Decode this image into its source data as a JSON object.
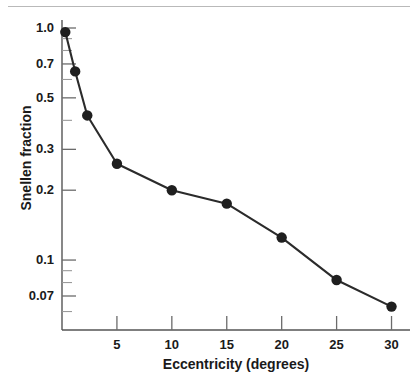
{
  "figure": {
    "background_color": "#ffffff",
    "top_rule_color": "#b9b9b9",
    "line_color": "#2b2b2b",
    "marker_color": "#1f1f1f",
    "axis_color": "#555555",
    "text_color": "#1a1a1a"
  },
  "chart_data": {
    "type": "line",
    "title": "",
    "xlabel": "Eccentricity (degrees)",
    "ylabel": "Snellen fraction",
    "xlim": [
      0,
      31.5
    ],
    "ylim": [
      0.055,
      1.12
    ],
    "yscale": "log",
    "xscale": "linear",
    "grid": false,
    "legend": "none",
    "markers": "filled-circle",
    "x": [
      0.3,
      1.2,
      2.3,
      5.0,
      10.0,
      15.0,
      20.0,
      25.0,
      30.0
    ],
    "y": [
      0.96,
      0.65,
      0.42,
      0.26,
      0.2,
      0.175,
      0.125,
      0.082,
      0.063
    ],
    "points": [
      {
        "x": 0.3,
        "y": 0.96
      },
      {
        "x": 1.2,
        "y": 0.65
      },
      {
        "x": 2.3,
        "y": 0.42
      },
      {
        "x": 5.0,
        "y": 0.26
      },
      {
        "x": 10.0,
        "y": 0.2
      },
      {
        "x": 15.0,
        "y": 0.175
      },
      {
        "x": 20.0,
        "y": 0.125
      },
      {
        "x": 25.0,
        "y": 0.082
      },
      {
        "x": 30.0,
        "y": 0.063
      }
    ],
    "xticks": [
      5,
      10,
      15,
      20,
      25,
      30
    ],
    "xtick_labels": [
      "5",
      "10",
      "15",
      "20",
      "25",
      "30"
    ],
    "yticks": [
      1.0,
      0.7,
      0.5,
      0.3,
      0.2,
      0.1,
      0.07
    ],
    "ytick_labels": [
      "1.0",
      "0.7",
      "0.5",
      "0.3",
      "0.2",
      "0.1",
      "0.07"
    ],
    "yticks_minor": [
      0.9,
      0.8,
      0.6,
      0.4,
      0.09,
      0.08,
      0.06
    ]
  }
}
